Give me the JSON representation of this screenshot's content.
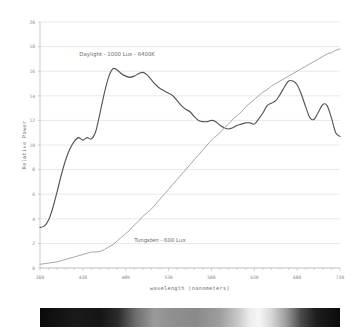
{
  "chart_data": {
    "type": "line",
    "title": "",
    "xlabel": "wavelength (nanometers)",
    "ylabel": "Relative Power",
    "xlim": [
      380,
      730
    ],
    "ylim": [
      0,
      20
    ],
    "xticks": [
      380,
      430,
      480,
      530,
      580,
      630,
      680,
      730
    ],
    "yticks": [
      0,
      2,
      4,
      6,
      8,
      10,
      12,
      14,
      16,
      18,
      20
    ],
    "xtick_labels": [
      "380",
      "430",
      "480",
      "530",
      "580",
      "630",
      "680",
      "730"
    ],
    "ytick_labels": [
      "0",
      "2",
      "4",
      "6",
      "8",
      "10",
      "12",
      "14",
      "16",
      "18",
      "20"
    ],
    "minor_tick_step": 10,
    "grid": "horizontal",
    "legend": "inline-annotations",
    "series": [
      {
        "name": "Daylight - 1000 Lux - 6400K",
        "color": "#555555",
        "label_x": 470,
        "label_y": 17.2,
        "x": [
          380,
          385,
          390,
          395,
          400,
          405,
          410,
          415,
          420,
          425,
          430,
          435,
          440,
          445,
          450,
          455,
          460,
          465,
          470,
          475,
          480,
          485,
          490,
          495,
          500,
          505,
          510,
          515,
          520,
          525,
          530,
          535,
          540,
          545,
          550,
          555,
          560,
          565,
          570,
          575,
          580,
          585,
          590,
          595,
          600,
          605,
          610,
          615,
          620,
          625,
          630,
          635,
          640,
          645,
          650,
          655,
          660,
          665,
          670,
          675,
          680,
          685,
          690,
          695,
          700,
          705,
          710,
          715,
          720,
          725,
          730
        ],
        "y": [
          3.3,
          3.4,
          3.9,
          4.9,
          6.2,
          7.6,
          8.8,
          9.7,
          10.3,
          10.6,
          10.4,
          10.6,
          10.5,
          11.1,
          12.6,
          14.2,
          15.5,
          16.2,
          16.1,
          15.8,
          15.6,
          15.5,
          15.6,
          15.8,
          15.9,
          15.7,
          15.3,
          14.9,
          14.6,
          14.4,
          14.2,
          14.0,
          13.6,
          13.2,
          12.9,
          12.7,
          12.3,
          12.0,
          11.9,
          11.9,
          12.0,
          11.9,
          11.6,
          11.4,
          11.3,
          11.4,
          11.6,
          11.7,
          11.8,
          11.8,
          11.7,
          12.1,
          12.6,
          13.2,
          13.4,
          13.6,
          14.1,
          14.7,
          15.2,
          15.2,
          14.9,
          14.1,
          13.1,
          12.2,
          12.1,
          12.7,
          13.3,
          13.2,
          12.2,
          11.0,
          10.7
        ]
      },
      {
        "name": "Tungsten - 600 Lux",
        "color": "#a0a0a0",
        "label_x": 520,
        "label_y": 2.1,
        "x": [
          380,
          385,
          390,
          395,
          400,
          405,
          410,
          415,
          420,
          425,
          430,
          435,
          440,
          445,
          450,
          455,
          460,
          465,
          470,
          475,
          480,
          485,
          490,
          495,
          500,
          505,
          510,
          515,
          520,
          525,
          530,
          535,
          540,
          545,
          550,
          555,
          560,
          565,
          570,
          575,
          580,
          585,
          590,
          595,
          600,
          605,
          610,
          615,
          620,
          625,
          630,
          635,
          640,
          645,
          650,
          655,
          660,
          665,
          670,
          675,
          680,
          685,
          690,
          695,
          700,
          705,
          710,
          715,
          720,
          725,
          730
        ],
        "y": [
          0.3,
          0.35,
          0.4,
          0.45,
          0.5,
          0.6,
          0.7,
          0.8,
          0.9,
          1.0,
          1.1,
          1.2,
          1.3,
          1.3,
          1.35,
          1.5,
          1.7,
          1.9,
          2.2,
          2.5,
          2.8,
          3.1,
          3.5,
          3.8,
          4.2,
          4.5,
          4.8,
          5.2,
          5.6,
          6.0,
          6.4,
          6.8,
          7.2,
          7.6,
          8.0,
          8.4,
          8.8,
          9.2,
          9.6,
          10.0,
          10.4,
          10.7,
          11.0,
          11.4,
          11.7,
          12.1,
          12.4,
          12.7,
          13.1,
          13.4,
          13.7,
          14.0,
          14.3,
          14.5,
          14.8,
          15.0,
          15.2,
          15.4,
          15.6,
          15.8,
          16.0,
          16.2,
          16.4,
          16.6,
          16.8,
          17.0,
          17.2,
          17.4,
          17.5,
          17.7,
          17.8
        ]
      }
    ]
  },
  "axes": {
    "ylabel": "Relative Power",
    "xlabel": "wavelength (nanometers)"
  },
  "spectrum": {
    "name": "visible-spectrum-bar",
    "stops": [
      {
        "pos": 0,
        "color": "#0a0a0a"
      },
      {
        "pos": 5,
        "color": "#121212"
      },
      {
        "pos": 12,
        "color": "#1a1a1a"
      },
      {
        "pos": 20,
        "color": "#151515"
      },
      {
        "pos": 26,
        "color": "#2b2b2b"
      },
      {
        "pos": 32,
        "color": "#6e6e6e"
      },
      {
        "pos": 38,
        "color": "#9a9a9a"
      },
      {
        "pos": 44,
        "color": "#8f8f8f"
      },
      {
        "pos": 52,
        "color": "#8a8a8a"
      },
      {
        "pos": 60,
        "color": "#9e9e9e"
      },
      {
        "pos": 66,
        "color": "#c8c8c8"
      },
      {
        "pos": 70,
        "color": "#ededed"
      },
      {
        "pos": 73,
        "color": "#f6f6f6"
      },
      {
        "pos": 77,
        "color": "#d8d8d8"
      },
      {
        "pos": 82,
        "color": "#9d9d9d"
      },
      {
        "pos": 87,
        "color": "#4a4a4a"
      },
      {
        "pos": 92,
        "color": "#1e1e1e"
      },
      {
        "pos": 100,
        "color": "#0b0b0b"
      }
    ]
  },
  "style": {
    "grid_color": "#d9d9d9",
    "axis_color": "#b5b5b5",
    "tick_label_color": "#8a8a8a",
    "background": "#ffffff"
  }
}
